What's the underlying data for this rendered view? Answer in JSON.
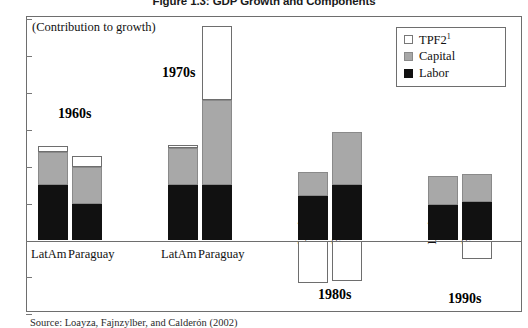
{
  "figure": {
    "title": "Figure 1.3: GDP Growth and Components",
    "contribution_note": "(Contribution to growth)",
    "source": "Source: Loayza, Fajnzylber, and Calderón (2002)"
  },
  "legend": {
    "position": "top-right",
    "items": [
      {
        "label": "TPF2",
        "superscript": "1",
        "color": "#ffffff",
        "name": "tpf2"
      },
      {
        "label": "Capital",
        "superscript": "",
        "color": "#a8a8a8",
        "name": "capital"
      },
      {
        "label": "Labor",
        "superscript": "",
        "color": "#111111",
        "name": "labor"
      }
    ]
  },
  "axis": {
    "ymin": -4,
    "ymax": 12,
    "ticks": [
      {
        "value": 12,
        "label": "1"
      },
      {
        "value": 10,
        "label": "1"
      },
      {
        "value": 8,
        "label": "8"
      },
      {
        "value": 6,
        "label": "6"
      },
      {
        "value": 4,
        "label": "4"
      },
      {
        "value": 2,
        "label": "2"
      },
      {
        "value": 0,
        "label": "0"
      },
      {
        "value": -2,
        "label": "-2"
      },
      {
        "value": -4,
        "label": "-4"
      }
    ]
  },
  "groups": [
    {
      "name": "1960s",
      "decade_label": "1960s"
    },
    {
      "name": "1970s",
      "decade_label": "1970s"
    },
    {
      "name": "1980s",
      "decade_label": "1980s"
    },
    {
      "name": "1990s",
      "decade_label": "1990s"
    }
  ],
  "xlabels": [
    {
      "text": "LatAm",
      "group": "1960s",
      "orientation": "horizontal"
    },
    {
      "text": "Paraguay",
      "group": "1960s",
      "orientation": "horizontal"
    },
    {
      "text": "LatAm",
      "group": "1970s",
      "orientation": "horizontal"
    },
    {
      "text": "Paraguay",
      "group": "1970s",
      "orientation": "horizontal"
    },
    {
      "text": "LatAm",
      "group": "1980s",
      "orientation": "vertical"
    },
    {
      "text": "Paraguay",
      "group": "1980s",
      "orientation": "vertical"
    },
    {
      "text": "LatAm",
      "group": "1990s",
      "orientation": "vertical"
    },
    {
      "text": "Paraguay",
      "group": "1990s",
      "orientation": "vertical"
    }
  ],
  "chart_data": {
    "type": "bar",
    "subtype": "stacked-bar",
    "title": "Figure 1.3: GDP Growth and Components",
    "xlabel": "",
    "ylabel": "(Contribution to growth)",
    "ylim": [
      -4,
      12
    ],
    "yticks": [
      -4,
      -2,
      0,
      2,
      4,
      6,
      8,
      10,
      12
    ],
    "grid": false,
    "legend_position": "top-right",
    "categories": [
      "1960s LatAm",
      "1960s Paraguay",
      "1970s LatAm",
      "1970s Paraguay",
      "1980s LatAm",
      "1980s Paraguay",
      "1990s LatAm",
      "1990s Paraguay"
    ],
    "series": [
      {
        "name": "Labor",
        "color": "#111111",
        "values": [
          3.0,
          2.0,
          3.0,
          3.0,
          2.4,
          3.0,
          1.9,
          2.1
        ]
      },
      {
        "name": "Capital",
        "color": "#a8a8a8",
        "values": [
          1.8,
          2.0,
          2.0,
          4.6,
          1.3,
          2.9,
          1.6,
          1.5
        ]
      },
      {
        "name": "TPF2",
        "color": "#ffffff",
        "values": [
          0.3,
          0.6,
          0.2,
          4.0,
          -2.3,
          -2.2,
          0.0,
          -1.0
        ]
      }
    ],
    "totals": [
      5.1,
      4.6,
      5.2,
      11.6,
      1.4,
      3.7,
      3.5,
      2.6
    ],
    "annotations": [
      "1960s",
      "1970s",
      "1980s",
      "1990s"
    ]
  },
  "bars": [
    {
      "name": "bar-1960s-latam",
      "x": 38,
      "width": 30,
      "labor": 3.0,
      "capital_top": 4.8,
      "tpf_top": 5.1,
      "tpf_bottom": 0
    },
    {
      "name": "bar-1960s-paraguay",
      "x": 72,
      "width": 30,
      "labor": 2.0,
      "capital_top": 4.0,
      "tpf_top": 4.6,
      "tpf_bottom": 0
    },
    {
      "name": "bar-1970s-latam",
      "x": 168,
      "width": 30,
      "labor": 3.0,
      "capital_top": 5.0,
      "tpf_top": 5.2,
      "tpf_bottom": 0
    },
    {
      "name": "bar-1970s-paraguay",
      "x": 202,
      "width": 30,
      "labor": 3.0,
      "capital_top": 7.6,
      "tpf_top": 11.6,
      "tpf_bottom": 0
    },
    {
      "name": "bar-1980s-latam",
      "x": 298,
      "width": 30,
      "labor": 2.4,
      "capital_top": 3.7,
      "tpf_top": 0,
      "tpf_bottom": -2.3
    },
    {
      "name": "bar-1980s-paraguay",
      "x": 332,
      "width": 30,
      "labor": 3.0,
      "capital_top": 5.9,
      "tpf_top": 0,
      "tpf_bottom": -2.2
    },
    {
      "name": "bar-1990s-latam",
      "x": 428,
      "width": 30,
      "labor": 1.9,
      "capital_top": 3.5,
      "tpf_top": 0,
      "tpf_bottom": 0
    },
    {
      "name": "bar-1990s-paraguay",
      "x": 462,
      "width": 30,
      "labor": 2.1,
      "capital_top": 3.6,
      "tpf_top": 0,
      "tpf_bottom": -1.0
    }
  ],
  "xlabel_pos": [
    {
      "x": 31,
      "y": 248,
      "orientation": "horizontal"
    },
    {
      "x": 68,
      "y": 248,
      "orientation": "horizontal"
    },
    {
      "x": 161,
      "y": 248,
      "orientation": "horizontal"
    },
    {
      "x": 198,
      "y": 248,
      "orientation": "horizontal"
    },
    {
      "x": 308,
      "y": 232,
      "orientation": "vertical"
    },
    {
      "x": 342,
      "y": 232,
      "orientation": "vertical"
    },
    {
      "x": 438,
      "y": 232,
      "orientation": "vertical"
    },
    {
      "x": 472,
      "y": 232,
      "orientation": "vertical"
    }
  ],
  "decade_pos": [
    {
      "x": 58,
      "y": 107
    },
    {
      "x": 162,
      "y": 66
    },
    {
      "x": 318,
      "y": 288
    },
    {
      "x": 448,
      "y": 292
    }
  ]
}
